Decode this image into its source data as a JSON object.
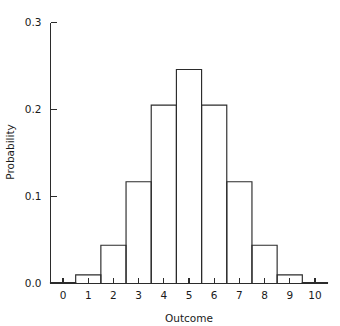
{
  "chart_data": {
    "type": "bar",
    "title": "",
    "subtitle": "",
    "xlabel": "Outcome",
    "ylabel": "Probability",
    "categories": [
      "0",
      "1",
      "2",
      "3",
      "4",
      "5",
      "6",
      "7",
      "8",
      "9",
      "10"
    ],
    "values": [
      0.001,
      0.01,
      0.044,
      0.117,
      0.205,
      0.246,
      0.205,
      0.117,
      0.044,
      0.01,
      0.001
    ],
    "xlim": [
      -0.5,
      10.5
    ],
    "ylim": [
      0.0,
      0.3
    ],
    "y_ticks": [
      0.0,
      0.1,
      0.2,
      0.3
    ],
    "y_tick_labels": [
      "0.0",
      "0.1",
      "0.2",
      "0.3"
    ],
    "x_ticks": [
      0,
      1,
      2,
      3,
      4,
      5,
      6,
      7,
      8,
      9,
      10
    ],
    "x_tick_labels": [
      "0",
      "1",
      "2",
      "3",
      "4",
      "5",
      "6",
      "7",
      "8",
      "9",
      "10"
    ],
    "grid": false,
    "legend": false,
    "legend_position": "none",
    "bar_style": "outline",
    "bar_fill": "#ffffff",
    "bar_stroke": "#2b2b2b",
    "axis_color": "#2b2b2b",
    "background": "#ffffff"
  },
  "axes": {
    "x_axis_label": "Outcome",
    "y_axis_label": "Probability"
  }
}
